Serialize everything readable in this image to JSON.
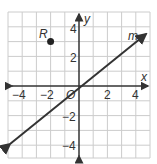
{
  "graph": {
    "x_axis_label": "x",
    "y_axis_label": "y",
    "origin_label": "O",
    "x_ticks": [
      {
        "value": -4,
        "label": "−4"
      },
      {
        "value": -2,
        "label": "−2"
      },
      {
        "value": 2,
        "label": "2"
      },
      {
        "value": 4,
        "label": "4"
      }
    ],
    "y_ticks": [
      {
        "value": 4,
        "label": "4"
      },
      {
        "value": 2,
        "label": "2"
      },
      {
        "value": -2,
        "label": "−2"
      },
      {
        "value": -4,
        "label": "−4"
      }
    ],
    "point": {
      "label": "R",
      "x": -2,
      "y": 3
    },
    "line": {
      "label": "m"
    },
    "colors": {
      "grid": "#cccccc",
      "axis": "#333333",
      "line": "#333333",
      "point": "#222222"
    }
  }
}
